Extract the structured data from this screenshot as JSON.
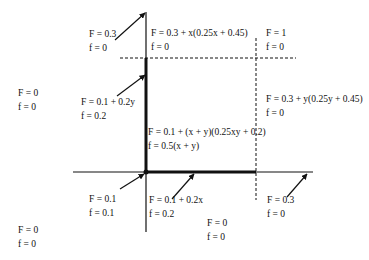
{
  "diagram": {
    "colors": {
      "ink": "#111111",
      "background": "#ffffff"
    },
    "regions": [
      {
        "id": "top-left-arrow",
        "F": "F = 0.3",
        "f": "f = 0",
        "x": 94,
        "y": 29
      },
      {
        "id": "top-upper",
        "F": "F = 0.3 + x(0.25x + 0.45)",
        "f": "f = 0",
        "x": 151,
        "y": 28
      },
      {
        "id": "top-right",
        "F": "F = 1",
        "f": "f = 0",
        "x": 264,
        "y": 28
      },
      {
        "id": "left-mid-arrow",
        "F": "F = 0.1 + 0.2y",
        "f": "f = 0.2",
        "x": 82,
        "y": 96
      },
      {
        "id": "far-left-upper",
        "F": "F = 0",
        "f": "f = 0",
        "x": 19,
        "y": 88
      },
      {
        "id": "right-mid",
        "F": "F = 0.3 + y(0.25y + 0.45)",
        "f": "f = 0",
        "x": 264,
        "y": 92
      },
      {
        "id": "center",
        "F": "F = 0.1 + (x + y)(0.25xy + 0.2)",
        "f": "f = 0.5(x + y)",
        "x": 148,
        "y": 128
      },
      {
        "id": "origin-arrow",
        "F": "F = 0.1",
        "f": "f = 0.1",
        "x": 90,
        "y": 193
      },
      {
        "id": "bottom-x-arrow",
        "F": "F = 0.1 + 0.2x",
        "f": "f = 0.2",
        "x": 149,
        "y": 194
      },
      {
        "id": "bottom-right-arrow",
        "F": "F = 0.3",
        "f": "f = 0",
        "x": 267,
        "y": 193
      },
      {
        "id": "bottom-center",
        "F": "F = 0",
        "f": "f = 0",
        "x": 208,
        "y": 217
      },
      {
        "id": "far-left-lower",
        "F": "F = 0",
        "f": "f = 0",
        "x": 19,
        "y": 224
      }
    ]
  }
}
